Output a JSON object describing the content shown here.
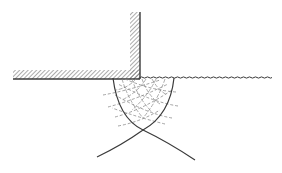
{
  "diagram": {
    "type": "slip-line-field",
    "background": "#ffffff",
    "stroke_color": "#3a3a3a",
    "hatch_color": "#5a5a5a",
    "dash_color": "#8a8a8a",
    "wall": {
      "horizontal_band": {
        "x1": 13,
        "x2": 140,
        "y_top": 70,
        "y_bottom": 79
      },
      "vertical_band": {
        "x_left": 130,
        "x2": 140,
        "y_top": 12,
        "y_bottom": 79
      }
    },
    "free_surface": {
      "x_start": 140,
      "x_end": 267,
      "y": 77.5,
      "style": "wavy"
    },
    "arcs": [
      {
        "name": "left-arc",
        "path": "M 113 78 Q 118 118 143 130 Q 122 145 97 157"
      },
      {
        "name": "right-arc",
        "path": "M 174 78 Q 170 115 143 130 Q 168 142 195 160"
      }
    ],
    "mesh_lines_dashed": [
      "M 103 95 Q 130 90 160 80",
      "M 108 107 Q 138 99 168 84",
      "M 115 117 Q 142 110 172 90",
      "M 118 126 Q 140 122 160 110",
      "M 176 92 Q 150 90 125 79",
      "M 178 106 Q 152 102 118 84",
      "M 172 118 Q 148 114 115 95",
      "M 165 124 Q 140 118 112 108"
    ],
    "mesh_lines_solid": [
      "M 122 79 Q 128 100 143 118",
      "M 132 79 Q 138 98 152 112",
      "M 142 79 Q 148 96 160 104",
      "M 152 79 Q 158 90 167 95",
      "M 165 79 Q 158 100 143 118",
      "M 156 79 Q 148 96 132 110",
      "M 146 79 Q 138 92 122 100",
      "M 136 79 Q 128 88 116 90"
    ]
  }
}
